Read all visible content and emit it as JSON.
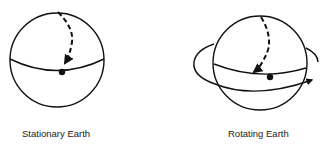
{
  "figures": [
    {
      "id": "stationary",
      "label": "Stationary Earth"
    },
    {
      "id": "rotating",
      "label": "Rotating Earth"
    }
  ],
  "colors": {
    "stroke": "#111111",
    "background": "#ffffff"
  }
}
